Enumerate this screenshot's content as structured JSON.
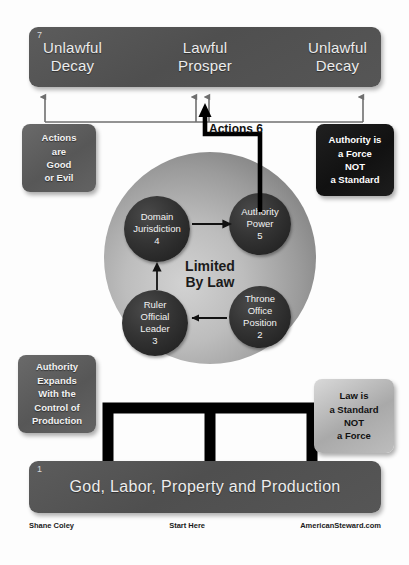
{
  "diagram": {
    "center_label": "Limited\nBy Law",
    "top_banner": {
      "number": "7",
      "columns": [
        "Unlawful\nDecay",
        "Lawful\nProsper",
        "Unlawful\nDecay"
      ]
    },
    "bottom_banner": {
      "number": "1",
      "text": "God, Labor, Property and Production"
    },
    "actions_label": "Actions 6",
    "nodes": [
      {
        "id": "node-4",
        "title": "Domain\nJurisdiction",
        "number": "4"
      },
      {
        "id": "node-5",
        "title": "Authority\nPower",
        "number": "5"
      },
      {
        "id": "node-3",
        "title": "Ruler\nOfficial\nLeader",
        "number": "3"
      },
      {
        "id": "node-2",
        "title": "Throne\nOffice\nPosition",
        "number": "2"
      }
    ],
    "callouts": [
      {
        "id": "callout-actions",
        "text": "Actions\nare\nGood\nor Evil",
        "style": "dark-gray"
      },
      {
        "id": "callout-authority-force",
        "text": "Authority is\na Force\nNOT\na Standard",
        "style": "black"
      },
      {
        "id": "callout-authority-expands",
        "text": "Authority\nExpands\nWith the\nControl of\nProduction",
        "style": "dark-gray"
      },
      {
        "id": "callout-law-standard",
        "text": "Law is\na Standard\nNOT\na Force",
        "style": "light"
      }
    ],
    "footer": {
      "author": "Shane Coley",
      "start": "Start Here",
      "site": "AmericanSteward.com"
    },
    "colors": {
      "banner": "#565656",
      "node": "#262626",
      "callout_dark": "#5e5e5e",
      "callout_black": "#161616",
      "callout_light": "#b8b8b8",
      "arrow_gray": "#777777",
      "arrow_black": "#000000"
    }
  }
}
